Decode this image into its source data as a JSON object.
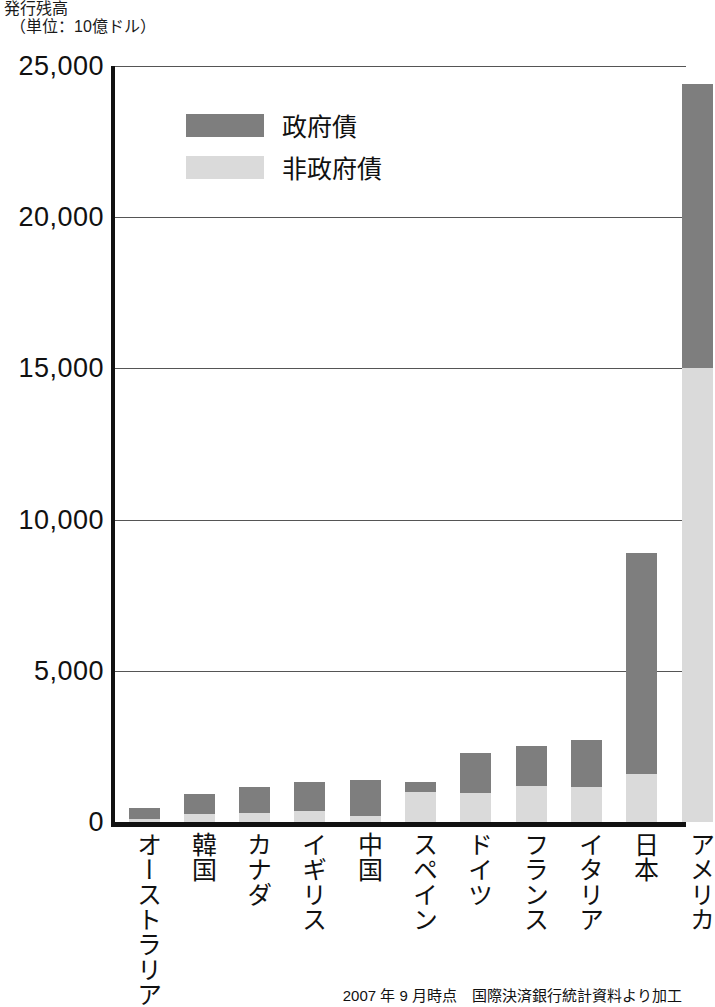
{
  "header": {
    "title": "発行残高",
    "unit": "（単位：10億ドル）"
  },
  "legend": {
    "items": [
      {
        "label": "政府債",
        "color": "#7e7e7e",
        "key": "government"
      },
      {
        "label": "非政府債",
        "color": "#dadada",
        "key": "non_government"
      }
    ]
  },
  "source_note": "2007 年 9 月時点　国際決済銀行統計資料より加工",
  "chart_data": {
    "type": "bar",
    "stacked": true,
    "title": "発行残高",
    "subtitle": "（単位：10億ドル）",
    "xlabel": "",
    "ylabel": "発行残高（単位：10億ドル）",
    "ylim": [
      0,
      25000
    ],
    "yticks": [
      0,
      5000,
      10000,
      15000,
      20000,
      25000
    ],
    "ytick_labels": [
      "0",
      "5,000",
      "10,000",
      "15,000",
      "20,000",
      "25,000"
    ],
    "grid": true,
    "legend_position": "upper-left-inside",
    "categories": [
      "オーストラリア",
      "韓国",
      "カナダ",
      "イギリス",
      "中国",
      "スペイン",
      "ドイツ",
      "フランス",
      "イタリア",
      "日本",
      "アメリカ"
    ],
    "series": [
      {
        "name": "非政府債",
        "color": "#dadada",
        "values": [
          100,
          250,
          300,
          350,
          200,
          980,
          950,
          1200,
          1150,
          1580,
          15000
        ]
      },
      {
        "name": "政府債",
        "color": "#7e7e7e",
        "values": [
          370,
          680,
          850,
          960,
          1180,
          340,
          1320,
          1300,
          1550,
          7320,
          9400
        ]
      }
    ],
    "totals": [
      470,
      930,
      1150,
      1310,
      1380,
      1320,
      2270,
      2500,
      2700,
      8900,
      24400
    ],
    "annotations": [
      "2007 年 9 月時点　国際決済銀行統計資料より加工"
    ]
  }
}
